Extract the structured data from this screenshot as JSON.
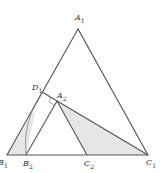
{
  "diagram": {
    "colors": {
      "stroke": "#555555",
      "fill": "#e6e6e6",
      "background": "#ffffff"
    },
    "points": {
      "A1": {
        "label": "A",
        "sub": "1",
        "x": 78,
        "y": 29
      },
      "B1": {
        "label": "B",
        "sub": "1",
        "x": 7,
        "y": 155
      },
      "C1": {
        "label": "C",
        "sub": "1",
        "x": 148,
        "y": 155
      },
      "D1": {
        "label": "D",
        "sub": "1",
        "x": 42,
        "y": 92
      },
      "A2": {
        "label": "A",
        "sub": "2",
        "x": 57,
        "y": 101
      },
      "B2": {
        "label": "B",
        "sub": "2",
        "x": 26,
        "y": 155
      },
      "C2": {
        "label": "C",
        "sub": "2",
        "x": 87,
        "y": 155
      }
    },
    "labels": [
      {
        "id": "A1",
        "text": "A",
        "sub": "1",
        "x": 75,
        "y": 14
      },
      {
        "id": "D1",
        "text": "D",
        "sub": "1",
        "x": 32,
        "y": 84
      },
      {
        "id": "A2",
        "text": "A",
        "sub": "2",
        "x": 57,
        "y": 92
      },
      {
        "id": "B1",
        "text": "B",
        "sub": "1",
        "x": 0,
        "y": 159
      },
      {
        "id": "B2",
        "text": "B",
        "sub": "2",
        "x": 23,
        "y": 160
      },
      {
        "id": "C2",
        "text": "C",
        "sub": "2",
        "x": 84,
        "y": 160
      },
      {
        "id": "C1",
        "text": "C",
        "sub": "1",
        "x": 146,
        "y": 159
      }
    ]
  }
}
